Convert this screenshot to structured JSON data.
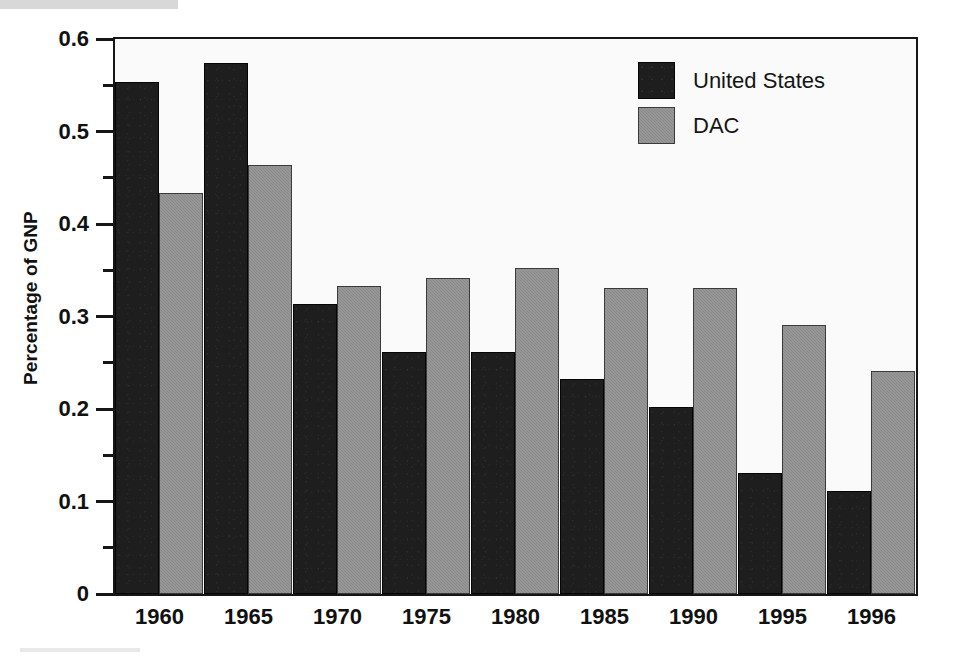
{
  "chart_data": {
    "type": "bar",
    "title": "",
    "xlabel": "",
    "ylabel": "Percentage of GNP",
    "categories": [
      "1960",
      "1965",
      "1970",
      "1975",
      "1980",
      "1985",
      "1990",
      "1995",
      "1996"
    ],
    "series": [
      {
        "name": "United States",
        "color": "#1e1e1e",
        "values": [
          0.554,
          0.574,
          0.313,
          0.262,
          0.262,
          0.232,
          0.202,
          0.131,
          0.111
        ]
      },
      {
        "name": "DAC",
        "color": "#8a8a8a",
        "values": [
          0.434,
          0.464,
          0.333,
          0.342,
          0.352,
          0.331,
          0.331,
          0.291,
          0.241
        ]
      }
    ],
    "ylim": [
      0,
      0.6
    ],
    "y_major_ticks": [
      0,
      0.1,
      0.2,
      0.3,
      0.4,
      0.5,
      0.6
    ],
    "y_major_tick_labels": [
      "0",
      "0.1",
      "0.2",
      "0.3",
      "0.4",
      "0.5",
      "0.6"
    ],
    "y_minor_ticks": [
      0.05,
      0.15,
      0.25,
      0.35,
      0.45,
      0.55
    ],
    "grid": false,
    "legend_position": "top-right"
  },
  "legend": {
    "entries": [
      {
        "label": "United States",
        "series": "us"
      },
      {
        "label": "DAC",
        "series": "dac"
      }
    ]
  },
  "axes": {
    "y_title": "Percentage of GNP"
  },
  "colors": {
    "bar_us": "#1e1e1e",
    "bar_dac": "#8a8a8a",
    "frame": "#161616",
    "plot_background": "#fafafa",
    "page_background": "#ffffff",
    "text": "#111111"
  }
}
